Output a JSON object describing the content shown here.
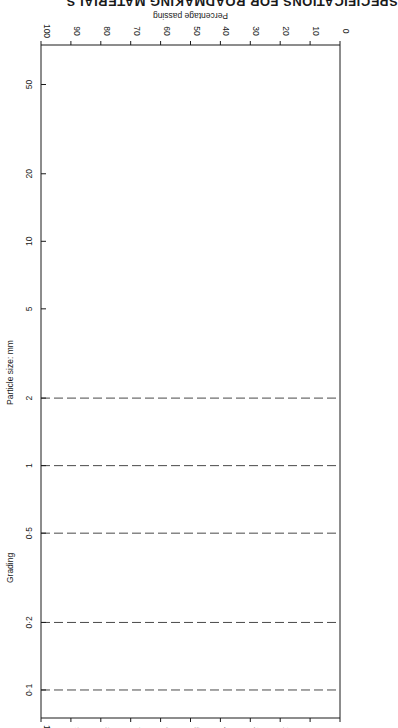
{
  "header": {
    "running_title": "SPECIFICATIONS FOR ROADMAKING MATERIALS"
  },
  "chart_data": {
    "type": "line",
    "title": "Grading",
    "orientation": "rotated 90 degrees (particle size axis vertical, percentage passing horizontal)",
    "xlabel": "BS sieve size",
    "ylabel": "Percentage passing",
    "secondary_xlabel": "Particle size: mm",
    "x_scale": "log",
    "ylim": [
      0,
      100
    ],
    "grid": "dashed vertical lines at particle sizes 0.1, 0.2, 0.5, 1, 2 mm",
    "legend": "inline labels along curves",
    "bs_sieve_sizes": {
      "mm": [
        "75",
        "63",
        "50",
        "37.5",
        "28",
        "20",
        "14",
        "10",
        "6.3",
        "5",
        "3.35",
        "2.36"
      ],
      "um": [
        "1.70",
        "1.18",
        "850",
        "600",
        "425",
        "300",
        "212",
        "150",
        "75"
      ],
      "group_labels": [
        "mm",
        "µm"
      ],
      "group_label_note": "1.70 and 1.18 sit between brackets (mm)"
    },
    "particle_size_ticks_mm": [
      "100",
      "50",
      "20",
      "10",
      "5",
      "2",
      "1",
      "0.5",
      "0.2",
      "0.1"
    ],
    "percent_ticks": [
      "0",
      "10",
      "20",
      "30",
      "40",
      "50",
      "60",
      "70",
      "80",
      "90",
      "100"
    ],
    "series": [
      {
        "name": "Coarse-grading limit for Type 1 and Type 2 granular sub-base",
        "marker": "filled-triangle",
        "points": [
          {
            "sieve_mm": 75,
            "passing": 100
          },
          {
            "sieve_mm": 37.5,
            "passing": 85
          },
          {
            "sieve_mm": 10,
            "passing": 40
          },
          {
            "sieve_mm": 5,
            "passing": 25
          },
          {
            "sieve_mm": 0.6,
            "passing": 8
          },
          {
            "sieve_mm": 0.075,
            "passing": 0
          }
        ]
      },
      {
        "name": "Fine-grading limit for Type 1 granular sub-base",
        "marker": "filled-circle",
        "points": [
          {
            "sieve_mm": 37.5,
            "passing": 100
          },
          {
            "sieve_mm": 10,
            "passing": 70
          },
          {
            "sieve_mm": 5,
            "passing": 45
          },
          {
            "sieve_mm": 0.6,
            "passing": 22
          },
          {
            "sieve_mm": 0.075,
            "passing": 10
          }
        ]
      },
      {
        "name": "Fine-grading limit for Type 2 granular sub-base",
        "marker": "open-circle",
        "points": [
          {
            "sieve_mm": 10,
            "passing": 100
          },
          {
            "sieve_mm": 5,
            "passing": 85
          },
          {
            "sieve_mm": 0.6,
            "passing": 45
          },
          {
            "sieve_mm": 0.075,
            "passing": 10
          }
        ]
      }
    ]
  }
}
